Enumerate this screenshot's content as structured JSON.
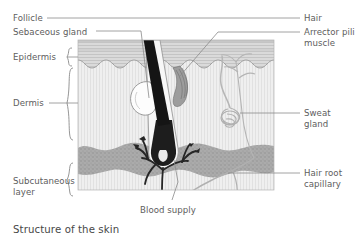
{
  "figure": {
    "caption": "Structure of the skin",
    "title": "Structure of the skin"
  },
  "labels": {
    "left": [
      {
        "id": "follicle",
        "text": "Follicle"
      },
      {
        "id": "sebaceous",
        "text": "Sebaceous gland"
      },
      {
        "id": "epidermis",
        "text": "Epidermis"
      },
      {
        "id": "dermis",
        "text": "Dermis"
      },
      {
        "id": "subcutaneous",
        "text": "Subcutaneous layer"
      }
    ],
    "right": [
      {
        "id": "hair",
        "text": "Hair"
      },
      {
        "id": "arrector",
        "text": "Arrector pili muscle"
      },
      {
        "id": "sweat",
        "text": "Sweat gland"
      },
      {
        "id": "hairroot",
        "text": "Hair root capillary"
      }
    ],
    "bottom": [
      {
        "id": "blood",
        "text": "Blood supply"
      }
    ]
  },
  "colors": {
    "background": "#ffffff",
    "label_text": "#5d5d5d",
    "caption_text": "#474747",
    "leader_line": "#8a8a8a",
    "epidermis_fill": "#d8d8d8",
    "epidermis_stripe": "#c2c2c2",
    "dermis_fill": "#eeeeee",
    "dermis_stripe": "#dcdcdc",
    "subcutaneous_fill": "#a8a8a8",
    "subcutaneous_speckle": "#8c8c8c",
    "hair_shaft": "#1a1a1a",
    "blood_vessel": "#2b2b2b",
    "sweat_duct": "#b4b4b4",
    "capillary": "#b0b0b0",
    "outline": "#9a9a9a"
  },
  "structures": [
    {
      "name": "hair-shaft",
      "label": "Hair"
    },
    {
      "name": "hair-follicle",
      "label": "Follicle"
    },
    {
      "name": "sebaceous-gland",
      "label": "Sebaceous gland"
    },
    {
      "name": "arrector-pili",
      "label": "Arrector pili muscle"
    },
    {
      "name": "sweat-gland",
      "label": "Sweat gland"
    },
    {
      "name": "blood-supply",
      "label": "Blood supply"
    },
    {
      "name": "hair-root-capillary",
      "label": "Hair root capillary"
    },
    {
      "name": "epidermis-layer",
      "label": "Epidermis"
    },
    {
      "name": "dermis-layer",
      "label": "Dermis"
    },
    {
      "name": "subcutaneous-layer",
      "label": "Subcutaneous layer"
    }
  ]
}
